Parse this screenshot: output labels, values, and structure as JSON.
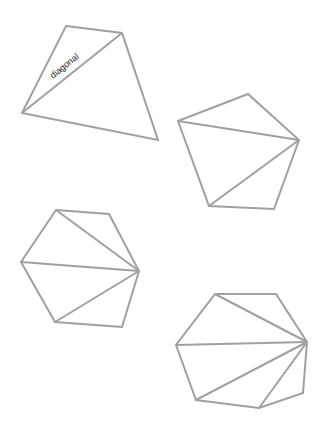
{
  "figure": {
    "background": "#ffffff",
    "stroke_color": "#a0a0a0",
    "label_text": "diagonal",
    "label": {
      "x": 53,
      "y": 79,
      "angle": -39
    },
    "polygons": [
      {
        "name": "quadrilateral",
        "points": [
          [
            66,
            26
          ],
          [
            122,
            33
          ],
          [
            158,
            140
          ],
          [
            22,
            113
          ]
        ],
        "diagonals": [
          [
            [
              22,
              113
            ],
            [
              122,
              33
            ]
          ]
        ]
      },
      {
        "name": "pentagon",
        "points": [
          [
            178,
            121
          ],
          [
            248,
            94
          ],
          [
            299,
            140
          ],
          [
            274,
            209
          ],
          [
            209,
            206
          ]
        ],
        "diagonals": [
          [
            [
              299,
              140
            ],
            [
              178,
              121
            ]
          ],
          [
            [
              299,
              140
            ],
            [
              209,
              206
            ]
          ]
        ]
      },
      {
        "name": "hexagon",
        "points": [
          [
            56,
            210
          ],
          [
            109,
            214
          ],
          [
            139,
            271
          ],
          [
            122,
            327
          ],
          [
            55,
            322
          ],
          [
            21,
            262
          ]
        ],
        "diagonals": [
          [
            [
              139,
              271
            ],
            [
              56,
              210
            ]
          ],
          [
            [
              139,
              271
            ],
            [
              21,
              262
            ]
          ],
          [
            [
              139,
              271
            ],
            [
              55,
              322
            ]
          ]
        ]
      },
      {
        "name": "heptagon",
        "points": [
          [
            215,
            294
          ],
          [
            276,
            294
          ],
          [
            307,
            342
          ],
          [
            303,
            393
          ],
          [
            259,
            408
          ],
          [
            196,
            400
          ],
          [
            176,
            345
          ]
        ],
        "diagonals": [
          [
            [
              307,
              342
            ],
            [
              215,
              294
            ]
          ],
          [
            [
              307,
              342
            ],
            [
              176,
              345
            ]
          ],
          [
            [
              307,
              342
            ],
            [
              196,
              400
            ]
          ],
          [
            [
              307,
              342
            ],
            [
              259,
              408
            ]
          ]
        ]
      }
    ]
  }
}
